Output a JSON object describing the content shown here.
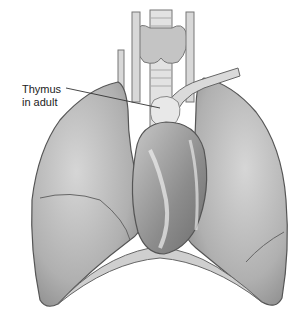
{
  "figure": {
    "labels": [
      {
        "line1": "Thymus",
        "line2": "in adult"
      }
    ]
  },
  "colors": {
    "background": "#ffffff",
    "lung": "#b8b8b8",
    "lung_dark": "#8a8a8a",
    "heart": "#9a9a9a",
    "fat": "#e6e6e6",
    "outline": "#555555",
    "leader_line": "#333333"
  }
}
